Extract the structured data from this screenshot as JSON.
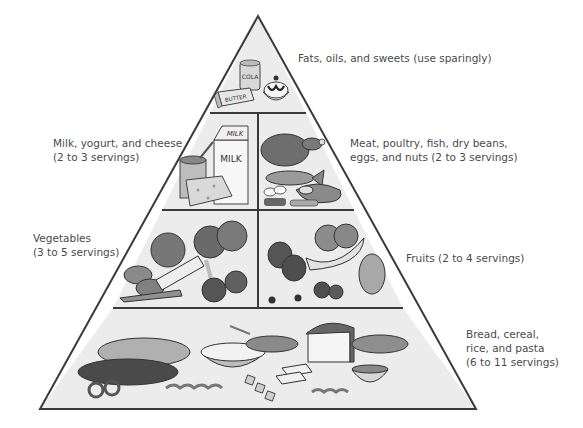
{
  "colors": {
    "outline": "#3a3a3a",
    "tier_fill": "#ececec",
    "label_text": "#4a4a4a"
  },
  "tiers": [
    {
      "id": "fats",
      "lines": [
        "Fats, oils, and sweets (use sparingly)"
      ],
      "foods": [
        "cola-can",
        "butter",
        "ice-cream-sundae"
      ],
      "food_labels": {
        "cola": "COLA",
        "butter": "BUTTER"
      }
    },
    {
      "id": "dairy",
      "lines": [
        "Milk, yogurt, and cheese",
        "(2 to 3 servings)"
      ],
      "foods": [
        "milk-carton",
        "yogurt-cup",
        "cheese-wedge"
      ],
      "food_labels": {
        "milk_top": "MILK",
        "milk_front": "MILK"
      }
    },
    {
      "id": "protein",
      "lines": [
        "Meat, poultry, fish, dry beans,",
        "eggs, and nuts (2 to 3 servings)"
      ],
      "foods": [
        "roast-chicken",
        "fish",
        "steak",
        "eggs",
        "beans",
        "nuts"
      ]
    },
    {
      "id": "vegetables",
      "lines": [
        "Vegetables",
        "(3 to 5 servings)"
      ],
      "foods": [
        "cabbage",
        "corn",
        "potatoes",
        "broccoli",
        "celery",
        "carrots",
        "tomatoes"
      ]
    },
    {
      "id": "fruits",
      "lines": [
        "Fruits (2 to 4 servings)"
      ],
      "foods": [
        "oranges",
        "apples",
        "bananas",
        "grapes",
        "strawberries",
        "cherries"
      ]
    },
    {
      "id": "grains",
      "lines": [
        "Bread, cereal,",
        "rice, and pasta",
        "(6 to 11 servings)"
      ],
      "foods": [
        "french-bread",
        "dark-bread",
        "pretzels",
        "rice-bowl",
        "cereal-bowl",
        "bread-loaf",
        "bread-slices",
        "crackers",
        "pasta",
        "soup-bowl",
        "baguette"
      ]
    }
  ]
}
